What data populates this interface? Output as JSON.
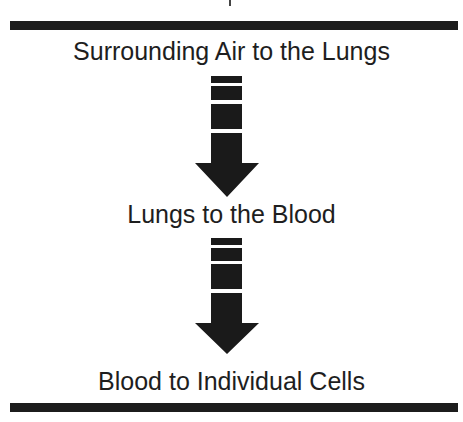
{
  "diagram": {
    "title": "",
    "steps": [
      {
        "label": "Surrounding Air to the Lungs"
      },
      {
        "label": "Lungs to the Blood"
      },
      {
        "label": "Blood to Individual Cells"
      }
    ],
    "connectors": [
      {
        "from": 0,
        "to": 1,
        "icon": "down-arrow-icon"
      },
      {
        "from": 1,
        "to": 2,
        "icon": "down-arrow-icon"
      }
    ],
    "colors": {
      "rule": "#1c1c1c",
      "arrow": "#1a1a1a",
      "text": "#1e1e1e",
      "background": "#ffffff"
    }
  }
}
